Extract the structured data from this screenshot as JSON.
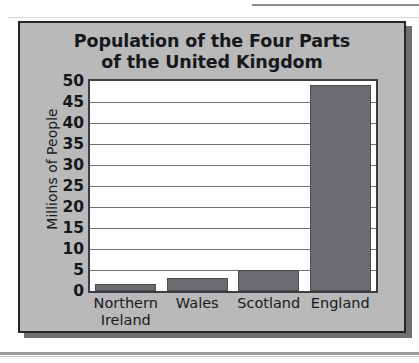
{
  "chart_data": {
    "type": "bar",
    "title": "Population of the Four Parts of the United Kingdom",
    "title_lines": [
      "Population of the Four Parts",
      "of the United Kingdom"
    ],
    "categories": [
      "Northern Ireland",
      "Wales",
      "Scotland",
      "England"
    ],
    "category_lines": [
      [
        "Northern",
        "Ireland"
      ],
      [
        "Wales"
      ],
      [
        "Scotland"
      ],
      [
        "England"
      ]
    ],
    "values": [
      1.7,
      3.0,
      5.1,
      49.0
    ],
    "xlabel": "",
    "ylabel": "Millions of People",
    "ylim": [
      0,
      50
    ],
    "y_ticks": [
      "0",
      "5",
      "10",
      "15",
      "20",
      "25",
      "30",
      "35",
      "40",
      "45",
      "50"
    ],
    "y_tick_values": [
      0,
      5,
      10,
      15,
      20,
      25,
      30,
      35,
      40,
      45,
      50
    ],
    "grid": true,
    "legend": "none",
    "bar_color": "#6a6c70",
    "plot_background": "#ffffff",
    "panel_background": "#b9b9b9",
    "axis_color": "#3c3e42",
    "text_color": "#16181c"
  }
}
